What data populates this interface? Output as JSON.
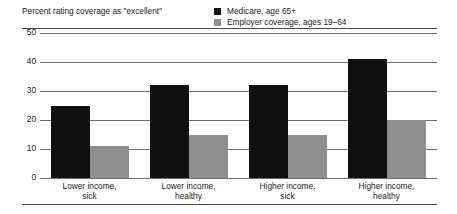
{
  "chart_data": {
    "type": "bar",
    "title": "Percent rating coverage as \"excellent\"",
    "xlabel": "",
    "ylabel": "",
    "ylim": [
      0,
      50
    ],
    "yticks": [
      50,
      40,
      30,
      20,
      10,
      0
    ],
    "grid": true,
    "legend_position": "top-right",
    "categories": [
      "Lower income, sick",
      "Lower income, healthy",
      "Higher income, sick",
      "Higher income, healthy"
    ],
    "category_lines": [
      [
        "Lower income,",
        "sick"
      ],
      [
        "Lower income,",
        "healthy"
      ],
      [
        "Higher income,",
        "sick"
      ],
      [
        "Higher income,",
        "healthy"
      ]
    ],
    "series": [
      {
        "name": "Medicare, age 65+",
        "color": "#101010",
        "values": [
          25,
          32,
          32,
          41
        ]
      },
      {
        "name": "Employer coverage, ages 19–64",
        "color": "#8f8f8f",
        "values": [
          11,
          15,
          15,
          20
        ]
      }
    ]
  },
  "legend": {
    "items": [
      {
        "label": "Medicare, age 65+",
        "color": "#101010"
      },
      {
        "label": "Employer coverage, ages 19–64",
        "color": "#8f8f8f"
      }
    ]
  }
}
